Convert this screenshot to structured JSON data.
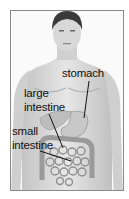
{
  "diagram": {
    "labels": {
      "stomach": "stomach",
      "large_intestine_line1": "large",
      "large_intestine_line2": "intestine",
      "small_intestine_line1": "small",
      "small_intestine_line2": "intestine"
    },
    "colors": {
      "skin": "#d9d9d9",
      "hair": "#3a3a3a",
      "organs": "#a8a8a8",
      "leader_lines": "#111111",
      "frame": "#8a8a8a"
    }
  }
}
